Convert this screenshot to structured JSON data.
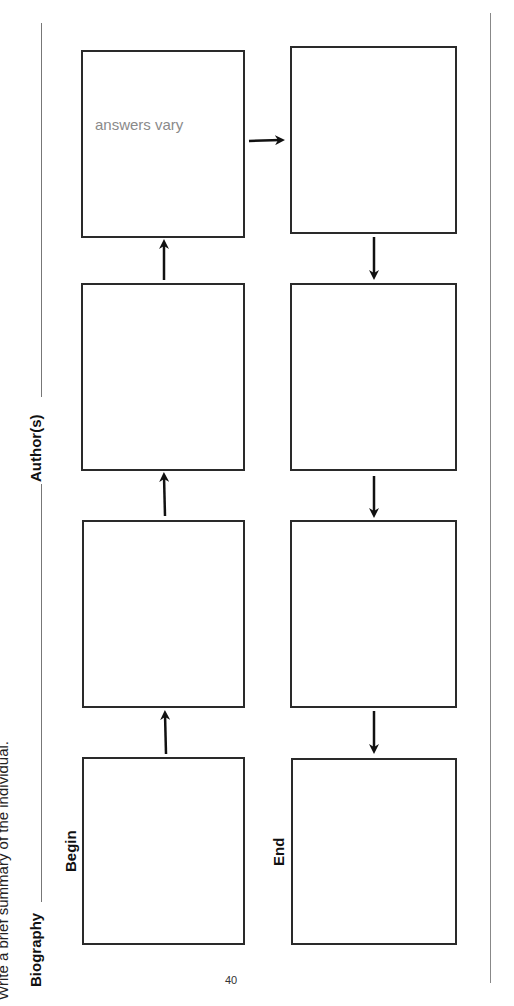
{
  "page": {
    "instruction": "Write a brief summary of the individual.",
    "biography_label": "Biography",
    "authors_label": "Author(s)",
    "page_number": "40"
  },
  "flowchart": {
    "begin_label": "Begin",
    "end_label": "End",
    "boxes": [
      {
        "id": 1,
        "note": ""
      },
      {
        "id": 2,
        "note": ""
      },
      {
        "id": 3,
        "note": ""
      },
      {
        "id": 4,
        "note": "answers vary"
      },
      {
        "id": 5,
        "note": ""
      },
      {
        "id": 6,
        "note": ""
      },
      {
        "id": 7,
        "note": ""
      },
      {
        "id": 8,
        "note": ""
      }
    ]
  },
  "colors": {
    "box_border": "#2a2a2a",
    "answer_text": "#8a8a8a",
    "rule_line": "#777777"
  }
}
